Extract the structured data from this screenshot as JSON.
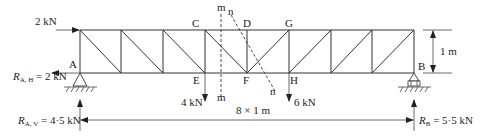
{
  "diagram": {
    "type": "pratt-truss-method-of-sections",
    "nodes": {
      "A": "A",
      "B": "B",
      "C": "C",
      "D": "D",
      "E": "E",
      "F": "F",
      "G": "G",
      "H": "H"
    },
    "section_lines": {
      "m_top": "m",
      "n_top": "n",
      "m_bottom": "m",
      "n_bottom": "n"
    },
    "loads": {
      "horizontal_top": "2 kN",
      "load_E": "4 kN",
      "load_H": "6 kN"
    },
    "reactions": {
      "RAH_sym": "R",
      "RAH_sub": "A, H",
      "RAH_val": " = 2 kN",
      "RAV_sym": "R",
      "RAV_sub": "A, V",
      "RAV_val": " = 4·5 kN",
      "RB_sym": "R",
      "RB_sub": "B",
      "RB_val": " = 5·5 kN"
    },
    "dimensions": {
      "height": "1 m",
      "span": "8 × 1 m"
    },
    "panels": 8,
    "panel_width_m": 1,
    "height_m": 1
  }
}
